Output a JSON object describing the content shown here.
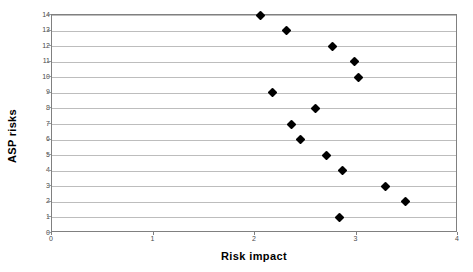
{
  "chart_data": {
    "type": "scatter",
    "title": "",
    "xlabel": "Risk impact",
    "ylabel": "ASP risks",
    "xlim": [
      0,
      4
    ],
    "ylim": [
      0,
      14
    ],
    "xticks": [
      0,
      1,
      2,
      3,
      4
    ],
    "yticks": [
      0,
      1,
      2,
      3,
      4,
      5,
      6,
      7,
      8,
      9,
      10,
      11,
      12,
      13,
      14
    ],
    "grid": "horizontal",
    "legend": "none",
    "marker": "filled-diamond",
    "marker_color": "#000000",
    "gridline_color": "#bdbdbd",
    "frame_color": "#808080",
    "background": "#ffffff",
    "series": [
      {
        "name": "ASP risk impact",
        "points": [
          {
            "y": 14,
            "x": 2.05
          },
          {
            "y": 13,
            "x": 2.31
          },
          {
            "y": 12,
            "x": 2.76
          },
          {
            "y": 11,
            "x": 2.98
          },
          {
            "y": 10,
            "x": 3.02
          },
          {
            "y": 9,
            "x": 2.17
          },
          {
            "y": 8,
            "x": 2.6
          },
          {
            "y": 7,
            "x": 2.36
          },
          {
            "y": 6,
            "x": 2.45
          },
          {
            "y": 5,
            "x": 2.7
          },
          {
            "y": 4,
            "x": 2.86
          },
          {
            "y": 3,
            "x": 3.29
          },
          {
            "y": 2,
            "x": 3.48
          },
          {
            "y": 1,
            "x": 2.83
          }
        ]
      }
    ]
  }
}
